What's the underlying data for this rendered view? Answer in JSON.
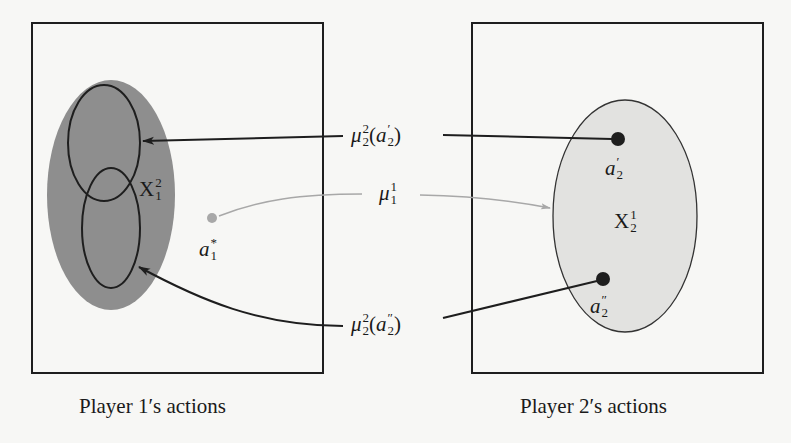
{
  "diagram": {
    "panels": [
      {
        "id": "player1",
        "caption": "Player 1′s actions"
      },
      {
        "id": "player2",
        "caption": "Player 2′s actions"
      }
    ],
    "sets": {
      "X12": {
        "base": "X",
        "sup": "2",
        "sub": "1"
      },
      "X21": {
        "base": "X",
        "sup": "1",
        "sub": "2"
      }
    },
    "points": {
      "a1_star": {
        "base": "a",
        "sup": "*",
        "sub": "1"
      },
      "a2_prime": {
        "base": "a",
        "prime": "′",
        "sub": "2"
      },
      "a2_dprime": {
        "base": "a",
        "prime": "″",
        "sub": "2"
      }
    },
    "mappings": {
      "mu22_a2p": {
        "base": "μ",
        "sup": "2",
        "sub": "2",
        "arg_base": "a",
        "arg_prime": "′",
        "arg_sub": "2"
      },
      "mu11": {
        "base": "μ",
        "sup": "1",
        "sub": "1"
      },
      "mu22_a2pp": {
        "base": "μ",
        "sup": "2",
        "sub": "2",
        "arg_base": "a",
        "arg_prime": "″",
        "arg_sub": "2"
      }
    },
    "colors": {
      "outline": "#1e1e1e",
      "dark_fill": "#8e8e8e",
      "light_fill": "#e2e2e0",
      "grey_arrow": "#a8a8a8",
      "background": "#f7f7f5"
    }
  }
}
